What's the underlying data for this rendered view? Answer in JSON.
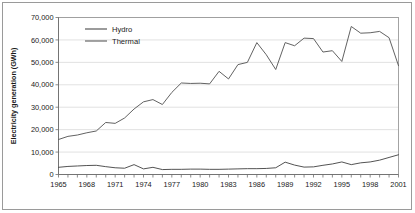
{
  "chart_data": {
    "type": "line",
    "title": "",
    "xlabel": "",
    "ylabel": "Electricity generation (GWh)",
    "xlim": [
      1965,
      2001
    ],
    "ylim": [
      0,
      70000
    ],
    "ytick_step": 10000,
    "grid": true,
    "legend_position": "top-left",
    "x": [
      1965,
      1966,
      1967,
      1968,
      1969,
      1970,
      1971,
      1972,
      1973,
      1974,
      1975,
      1976,
      1977,
      1978,
      1979,
      1980,
      1981,
      1982,
      1983,
      1984,
      1985,
      1986,
      1987,
      1988,
      1989,
      1990,
      1991,
      1992,
      1993,
      1994,
      1995,
      1996,
      1997,
      1998,
      1999,
      2000,
      2001
    ],
    "xtick_labels": [
      "1965",
      "1968",
      "1971",
      "1974",
      "1977",
      "1980",
      "1983",
      "1986",
      "1989",
      "1992",
      "1995",
      "1998",
      "2001"
    ],
    "ytick_labels": [
      "0",
      "10,000",
      "20,000",
      "30,000",
      "40,000",
      "50,000",
      "60,000",
      "70,000"
    ],
    "series": [
      {
        "name": "Hydro",
        "color": "#4a4a4a",
        "values": [
          3200,
          3600,
          3800,
          4000,
          4100,
          3500,
          3000,
          2800,
          4400,
          2500,
          3200,
          2200,
          2300,
          2300,
          2400,
          2400,
          2300,
          2300,
          2400,
          2500,
          2600,
          2600,
          2700,
          3000,
          5500,
          4200,
          3300,
          3400,
          4100,
          4700,
          5600,
          4400,
          5200,
          5600,
          6400,
          7600,
          8800
        ]
      },
      {
        "name": "Thermal",
        "color": "#5a5a5a",
        "values": [
          15600,
          17000,
          17600,
          18600,
          19400,
          23200,
          22800,
          25200,
          29200,
          32400,
          33400,
          31200,
          36600,
          40800,
          40600,
          40700,
          40400,
          46000,
          42600,
          49000,
          50000,
          58800,
          53400,
          46800,
          58800,
          57400,
          60800,
          60600,
          54600,
          55200,
          50400,
          66000,
          63000,
          63200,
          63800,
          61000,
          48500
        ]
      }
    ]
  },
  "legend": {
    "items": [
      {
        "label": "Hydro"
      },
      {
        "label": "Thermal"
      }
    ]
  }
}
